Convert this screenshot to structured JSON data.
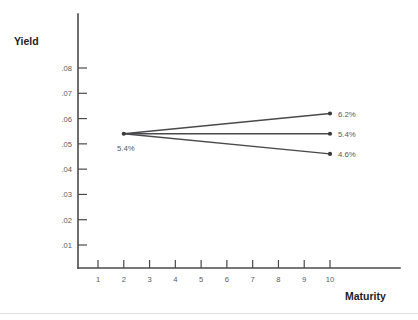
{
  "chart_data": {
    "type": "line",
    "title": "",
    "xlabel": "Maturity",
    "ylabel": "Yield",
    "xlim": [
      0,
      11.6
    ],
    "ylim": [
      0,
      0.088
    ],
    "grid": false,
    "legend": "none",
    "x_ticks": [
      "1",
      "2",
      "3",
      "4",
      "5",
      "6",
      "7",
      "8",
      "9",
      "10"
    ],
    "x_tick_values": [
      1,
      2,
      3,
      4,
      5,
      6,
      7,
      8,
      9,
      10
    ],
    "y_ticks": [
      ".01",
      ".02",
      ".03",
      ".04",
      ".05",
      ".06",
      ".07",
      ".08"
    ],
    "y_tick_values": [
      0.01,
      0.02,
      0.03,
      0.04,
      0.05,
      0.06,
      0.07,
      0.08
    ],
    "origin_label": "5.4%",
    "origin_point": {
      "x": 2,
      "y": 0.054
    },
    "series": [
      {
        "name": "rising",
        "end_label": "6.2%",
        "x": [
          2,
          10
        ],
        "values": [
          0.054,
          0.062
        ]
      },
      {
        "name": "flat",
        "end_label": "5.4%",
        "x": [
          2,
          10
        ],
        "values": [
          0.054,
          0.054
        ]
      },
      {
        "name": "falling",
        "end_label": "4.6%",
        "x": [
          2,
          10
        ],
        "values": [
          0.054,
          0.046
        ]
      }
    ],
    "colors": {
      "line": "#4a4a4d",
      "axis": "#4a4a4d",
      "tick_label": "#5a5a5d",
      "axis_title": "#1d1d1f",
      "background": "#ffffff"
    }
  }
}
